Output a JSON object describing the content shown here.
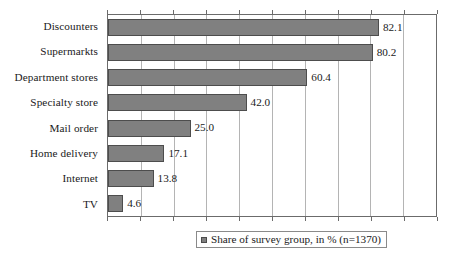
{
  "chart_data": {
    "type": "bar",
    "orientation": "horizontal",
    "title": "",
    "xlabel": "",
    "ylabel": "",
    "xlim": [
      0,
      100
    ],
    "xtick_step": 10,
    "grid": true,
    "legend_position": "bottom",
    "categories": [
      "Discounters",
      "Supermarkts",
      "Department stores",
      "Specialty store",
      "Mail order",
      "Home delivery",
      "Internet",
      "TV"
    ],
    "values": [
      82.1,
      80.2,
      60.4,
      42.0,
      25.0,
      17.1,
      13.8,
      4.6
    ],
    "value_labels": [
      "82.1",
      "80.2",
      "60.4",
      "42.0",
      "25.0",
      "17.1",
      "13.8",
      "4.6"
    ],
    "series": [
      {
        "name": "Share of survey group, in % (n=1370)",
        "values": [
          82.1,
          80.2,
          60.4,
          42.0,
          25.0,
          17.1,
          13.8,
          4.6
        ]
      }
    ],
    "legend": [
      {
        "label": "Share of survey group, in % (n=1370)",
        "color": "#808080"
      }
    ]
  },
  "colors": {
    "bar_fill": "#808080",
    "bar_border": "#4d4d4d",
    "gridline": "#b4b4b4",
    "axis": "#6b6b6b",
    "text": "#1a1a1a",
    "background": "#ffffff"
  }
}
